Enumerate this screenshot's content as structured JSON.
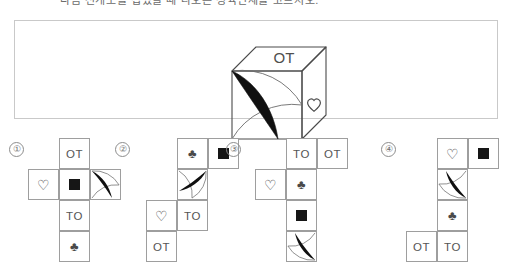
{
  "header": {
    "text": "다음 전개도를 접었을 때 나오는 정육면체를 고르시오."
  },
  "question": {
    "panel_name": "question-figure-panel",
    "cube": {
      "top_face_label": "OT",
      "right_face_symbol": "heart",
      "front_face_symbol": "crescent"
    }
  },
  "colors": {
    "border": "#c9c9c9",
    "cell_border": "#9e9e9e",
    "ink": "#555555",
    "solid_fill": "#161616",
    "background": "#ffffff"
  },
  "symbols": {
    "heart": "♡",
    "club": "♣",
    "square": "black-square",
    "crescent": "black-crescent"
  },
  "options": [
    {
      "marker": "①",
      "name": "option-1",
      "layout": "cross",
      "cells": [
        {
          "name": "cell-ot",
          "type": "text",
          "value": "OT",
          "col": 1,
          "row": 0
        },
        {
          "name": "cell-heart",
          "type": "symbol",
          "value": "♡",
          "col": 0,
          "row": 1
        },
        {
          "name": "cell-square",
          "type": "symbol",
          "value": "black-square",
          "col": 1,
          "row": 1
        },
        {
          "name": "cell-crescent",
          "type": "symbol",
          "value": "black-crescent",
          "col": 2,
          "row": 1,
          "crescent_rotation": 0
        },
        {
          "name": "cell-to",
          "type": "text",
          "value": "TO",
          "col": 1,
          "row": 2
        },
        {
          "name": "cell-club",
          "type": "symbol",
          "value": "♣",
          "col": 1,
          "row": 3
        }
      ]
    },
    {
      "marker": "②",
      "name": "option-2",
      "layout": "staircase",
      "cells": [
        {
          "name": "cell-club",
          "type": "symbol",
          "value": "♣",
          "col": 1,
          "row": 0
        },
        {
          "name": "cell-square",
          "type": "symbol",
          "value": "black-square",
          "col": 2,
          "row": 0
        },
        {
          "name": "cell-crescent",
          "type": "symbol",
          "value": "black-crescent",
          "col": 1,
          "row": 1,
          "crescent_rotation": 90
        },
        {
          "name": "cell-heart",
          "type": "symbol",
          "value": "♡",
          "col": 0,
          "row": 2
        },
        {
          "name": "cell-to",
          "type": "text",
          "value": "TO",
          "col": 1,
          "row": 2
        },
        {
          "name": "cell-ot",
          "type": "text",
          "value": "OT",
          "col": 0,
          "row": 3
        }
      ]
    },
    {
      "marker": "③",
      "name": "option-3",
      "layout": "staircase",
      "cells": [
        {
          "name": "cell-to",
          "type": "text",
          "value": "TO",
          "col": 1,
          "row": 0
        },
        {
          "name": "cell-ot",
          "type": "text",
          "value": "OT",
          "col": 2,
          "row": 0
        },
        {
          "name": "cell-heart",
          "type": "symbol",
          "value": "♡",
          "col": 0,
          "row": 1
        },
        {
          "name": "cell-club",
          "type": "symbol",
          "value": "♣",
          "col": 1,
          "row": 1
        },
        {
          "name": "cell-square",
          "type": "symbol",
          "value": "black-square",
          "col": 1,
          "row": 2
        },
        {
          "name": "cell-crescent",
          "type": "symbol",
          "value": "black-crescent",
          "col": 1,
          "row": 3,
          "crescent_rotation": 180
        }
      ]
    },
    {
      "marker": "④",
      "name": "option-4",
      "layout": "staircase",
      "cells": [
        {
          "name": "cell-heart",
          "type": "symbol",
          "value": "♡",
          "col": 1,
          "row": 0
        },
        {
          "name": "cell-square",
          "type": "symbol",
          "value": "black-square",
          "col": 2,
          "row": 0
        },
        {
          "name": "cell-crescent",
          "type": "symbol",
          "value": "black-crescent",
          "col": 1,
          "row": 1,
          "crescent_rotation": 180
        },
        {
          "name": "cell-club",
          "type": "symbol",
          "value": "♣",
          "col": 1,
          "row": 2
        },
        {
          "name": "cell-ot",
          "type": "text",
          "value": "OT",
          "col": 0,
          "row": 3
        },
        {
          "name": "cell-to",
          "type": "text",
          "value": "TO",
          "col": 1,
          "row": 3
        }
      ]
    }
  ]
}
